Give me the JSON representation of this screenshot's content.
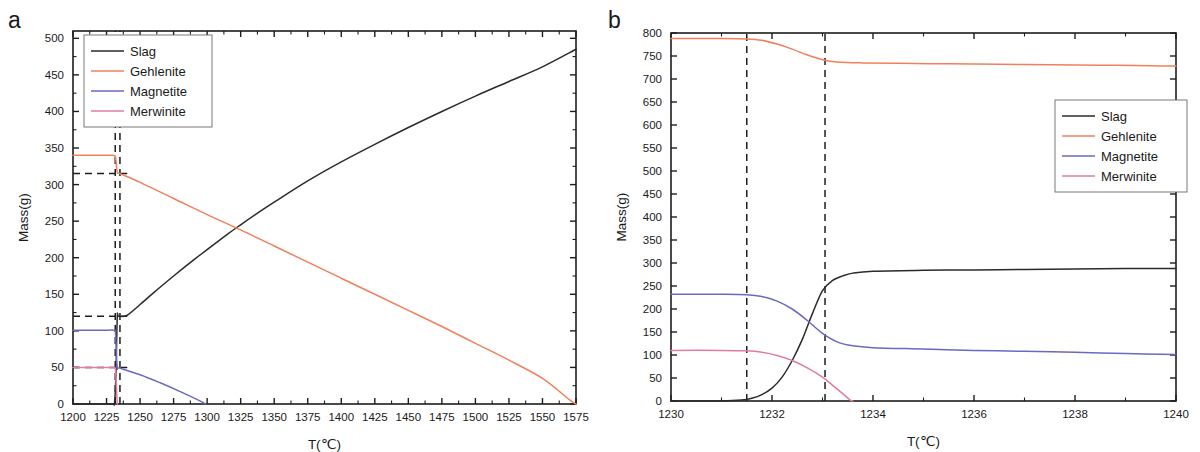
{
  "figure": {
    "background": "#ffffff",
    "panels": [
      "a",
      "b"
    ]
  },
  "panel_a": {
    "letter": "a",
    "legend": {
      "position": "top-left",
      "entries": [
        {
          "label": "Slag",
          "color": "#2b2b2b"
        },
        {
          "label": "Gehlenite",
          "color": "#f0805c"
        },
        {
          "label": "Magnetite",
          "color": "#6a6ac0"
        },
        {
          "label": "Merwinite",
          "color": "#e07ba8"
        }
      ]
    }
  },
  "panel_b": {
    "letter": "b",
    "legend": {
      "position": "right",
      "entries": [
        {
          "label": "Slag",
          "color": "#2b2b2b"
        },
        {
          "label": "Gehlenite",
          "color": "#f0805c"
        },
        {
          "label": "Magnetite",
          "color": "#6a6ac0"
        },
        {
          "label": "Merwinite",
          "color": "#e07ba8"
        }
      ]
    }
  },
  "chart_data": [
    {
      "panel": "a",
      "type": "line",
      "title": "",
      "xlabel": "T(℃)",
      "ylabel": "Mass(g)",
      "xlim": [
        1200,
        1575
      ],
      "ylim": [
        0,
        510
      ],
      "xticks": [
        1200,
        1225,
        1250,
        1275,
        1300,
        1325,
        1350,
        1375,
        1400,
        1425,
        1450,
        1475,
        1500,
        1525,
        1550,
        1575
      ],
      "yticks": [
        0,
        50,
        100,
        150,
        200,
        250,
        300,
        350,
        400,
        450,
        500
      ],
      "xtick_labels": [
        "1200",
        "1225",
        "1250",
        "1275",
        "1300",
        "1325",
        "1350",
        "1375",
        "1400",
        "1425",
        "1450",
        "1475",
        "1500",
        "1525",
        "1550",
        "1575"
      ],
      "ytick_labels": [
        "0",
        "50",
        "100",
        "150",
        "200",
        "250",
        "300",
        "350",
        "400",
        "450",
        "500"
      ],
      "x_minor_per_major": 2,
      "y_minor_per_major": 2,
      "grid": false,
      "legend_position": "top-left",
      "series": [
        {
          "name": "Slag",
          "color": "#2b2b2b",
          "points": [
            [
              1200,
              0
            ],
            [
              1228,
              0
            ],
            [
              1230,
              0
            ],
            [
              1231,
              2
            ],
            [
              1232,
              40
            ],
            [
              1233,
              118
            ],
            [
              1234,
              120
            ],
            [
              1240,
              121
            ],
            [
              1250,
              136
            ],
            [
              1260,
              152
            ],
            [
              1275,
              175
            ],
            [
              1290,
              197
            ],
            [
              1300,
              211
            ],
            [
              1315,
              232
            ],
            [
              1325,
              245
            ],
            [
              1340,
              264
            ],
            [
              1350,
              276
            ],
            [
              1375,
              305
            ],
            [
              1400,
              331
            ],
            [
              1425,
              355
            ],
            [
              1450,
              378
            ],
            [
              1475,
              400
            ],
            [
              1500,
              421
            ],
            [
              1525,
              441
            ],
            [
              1550,
              461
            ],
            [
              1575,
              485
            ]
          ]
        },
        {
          "name": "Gehlenite",
          "color": "#f0805c",
          "points": [
            [
              1200,
              340
            ],
            [
              1220,
              340
            ],
            [
              1228,
              340
            ],
            [
              1230,
              340
            ],
            [
              1231.5,
              339
            ],
            [
              1232,
              333
            ],
            [
              1233,
              317
            ],
            [
              1235,
              315
            ],
            [
              1250,
              303
            ],
            [
              1275,
              281
            ],
            [
              1300,
              259
            ],
            [
              1325,
              238
            ],
            [
              1350,
              216
            ],
            [
              1375,
              194
            ],
            [
              1400,
              172
            ],
            [
              1425,
              150
            ],
            [
              1450,
              128
            ],
            [
              1475,
              106
            ],
            [
              1500,
              83
            ],
            [
              1525,
              60
            ],
            [
              1550,
              35
            ],
            [
              1570,
              6
            ],
            [
              1575,
              0
            ]
          ]
        },
        {
          "name": "Magnetite",
          "color": "#6a6ac0",
          "points": [
            [
              1200,
              101
            ],
            [
              1225,
              101
            ],
            [
              1230,
              101
            ],
            [
              1231.5,
              100
            ],
            [
              1232,
              85
            ],
            [
              1233,
              50
            ],
            [
              1235,
              49
            ],
            [
              1250,
              40
            ],
            [
              1265,
              29
            ],
            [
              1280,
              17
            ],
            [
              1295,
              4
            ],
            [
              1299,
              0
            ]
          ]
        },
        {
          "name": "Merwinite",
          "color": "#e07ba8",
          "points": [
            [
              1200,
              50
            ],
            [
              1225,
              50
            ],
            [
              1230,
              50
            ],
            [
              1231.5,
              49
            ],
            [
              1232,
              36
            ],
            [
              1232.6,
              14
            ],
            [
              1233,
              0
            ]
          ]
        }
      ],
      "annotations": {
        "vertical_dashed_x": [
          1231.5,
          1235
        ],
        "horizontal_dashed_y": [
          315,
          120,
          50
        ],
        "description": "dashed guide lines marking the phase-transition window near 1231-1235 C"
      }
    },
    {
      "panel": "b",
      "type": "line",
      "title": "",
      "xlabel": "T(℃)",
      "ylabel": "Mass(g)",
      "xlim": [
        1230,
        1240
      ],
      "ylim": [
        0,
        800
      ],
      "xticks": [
        1230,
        1232,
        1234,
        1236,
        1238,
        1240
      ],
      "yticks": [
        0,
        50,
        100,
        150,
        200,
        250,
        300,
        350,
        400,
        450,
        500,
        550,
        600,
        650,
        700,
        750,
        800
      ],
      "xtick_labels": [
        "1230",
        "1232",
        "1234",
        "1236",
        "1238",
        "1240"
      ],
      "ytick_labels": [
        "0",
        "50",
        "100",
        "150",
        "200",
        "250",
        "300",
        "350",
        "400",
        "450",
        "500",
        "550",
        "600",
        "650",
        "700",
        "750",
        "800"
      ],
      "x_minor_per_major": 2,
      "y_minor_per_major": 1,
      "grid": false,
      "legend_position": "right",
      "series": [
        {
          "name": "Slag",
          "color": "#2b2b2b",
          "points": [
            [
              1230,
              0
            ],
            [
              1231,
              0
            ],
            [
              1231.4,
              2
            ],
            [
              1231.6,
              6
            ],
            [
              1231.8,
              14
            ],
            [
              1232.0,
              28
            ],
            [
              1232.2,
              52
            ],
            [
              1232.4,
              88
            ],
            [
              1232.6,
              134
            ],
            [
              1232.8,
              190
            ],
            [
              1233.0,
              240
            ],
            [
              1233.2,
              262
            ],
            [
              1233.4,
              272
            ],
            [
              1233.6,
              278
            ],
            [
              1234.0,
              282
            ],
            [
              1235.0,
              284
            ],
            [
              1236.0,
              285
            ],
            [
              1237.0,
              286
            ],
            [
              1238.0,
              287
            ],
            [
              1239.0,
              288
            ],
            [
              1240.0,
              288
            ]
          ]
        },
        {
          "name": "Gehlenite",
          "color": "#f0805c",
          "points": [
            [
              1230,
              788
            ],
            [
              1231.0,
              788
            ],
            [
              1231.5,
              787
            ],
            [
              1231.8,
              784
            ],
            [
              1232.1,
              776
            ],
            [
              1232.4,
              765
            ],
            [
              1232.7,
              752
            ],
            [
              1233.0,
              742
            ],
            [
              1233.3,
              737
            ],
            [
              1233.8,
              735
            ],
            [
              1234.5,
              734
            ],
            [
              1235.5,
              733
            ],
            [
              1236.5,
              732
            ],
            [
              1237.5,
              731
            ],
            [
              1238.5,
              730
            ],
            [
              1239.5,
              729
            ],
            [
              1240,
              728
            ]
          ]
        },
        {
          "name": "Magnetite",
          "color": "#6a6ac0",
          "points": [
            [
              1230,
              232
            ],
            [
              1231.0,
              232
            ],
            [
              1231.5,
              231
            ],
            [
              1231.8,
              227
            ],
            [
              1232.1,
              217
            ],
            [
              1232.4,
              200
            ],
            [
              1232.7,
              175
            ],
            [
              1233.0,
              147
            ],
            [
              1233.3,
              128
            ],
            [
              1233.6,
              120
            ],
            [
              1234.0,
              116
            ],
            [
              1235.0,
              113
            ],
            [
              1236.0,
              110
            ],
            [
              1237.0,
              108
            ],
            [
              1238.0,
              106
            ],
            [
              1239.0,
              103
            ],
            [
              1240.0,
              101
            ]
          ]
        },
        {
          "name": "Merwinite",
          "color": "#e07ba8",
          "points": [
            [
              1230,
              110
            ],
            [
              1231.0,
              110
            ],
            [
              1231.5,
              109
            ],
            [
              1231.8,
              106
            ],
            [
              1232.1,
              99
            ],
            [
              1232.4,
              88
            ],
            [
              1232.7,
              72
            ],
            [
              1233.0,
              52
            ],
            [
              1233.2,
              34
            ],
            [
              1233.4,
              16
            ],
            [
              1233.55,
              2
            ],
            [
              1233.6,
              0
            ]
          ]
        }
      ],
      "annotations": {
        "vertical_dashed_x": [
          1231.5,
          1233.05
        ],
        "horizontal_dashed_y": [],
        "description": "two vertical dashed guide lines bracketing the transition interval"
      }
    }
  ]
}
